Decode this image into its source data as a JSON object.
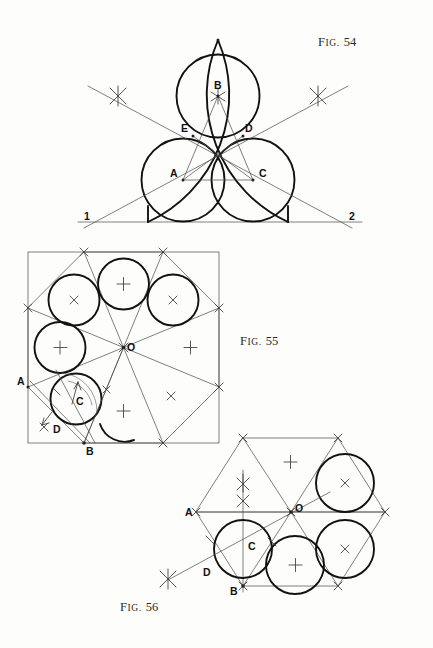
{
  "page": {
    "background": "#fdfdfb",
    "ink": "#1a1a1a",
    "thin_ink": "#4a4a4a"
  },
  "figures": [
    {
      "id": "fig54",
      "label_prefix": "Fig.",
      "label_number": "54",
      "caption_position": "top-right",
      "description": "Pointed arch with three inscribed tangent circles",
      "point_labels": [
        "B",
        "E",
        "D",
        "A",
        "C"
      ],
      "baseline_labels": [
        "1",
        "2"
      ],
      "marks": {
        "cross_x": 0,
        "cross_plus": 0
      }
    },
    {
      "id": "fig55",
      "label_prefix": "Fig.",
      "label_number": "55",
      "caption_position": "middle-right",
      "description": "Square with inscribed octagon, eight radial triangles and five circles",
      "point_labels": [
        "O",
        "A",
        "C",
        "D",
        "B"
      ],
      "marks": {
        "cross_x": 3,
        "cross_plus": 4
      }
    },
    {
      "id": "fig56",
      "label_prefix": "Fig.",
      "label_number": "56",
      "caption_position": "bottom-left",
      "description": "Hexagon with six radial triangles and four inscribed circles",
      "point_labels": [
        "A",
        "O",
        "C",
        "D",
        "B"
      ],
      "marks": {
        "cross_x": 2,
        "cross_plus": 2
      }
    }
  ],
  "labels": {
    "fig54": {
      "B": "B",
      "E": "E",
      "D": "D",
      "A": "A",
      "C": "C",
      "one": "1",
      "two": "2"
    },
    "fig55": {
      "O": "O",
      "A": "A",
      "C": "C",
      "D": "D",
      "B": "B"
    },
    "fig56": {
      "A": "A",
      "O": "O",
      "C": "C",
      "D": "D",
      "B": "B"
    }
  }
}
